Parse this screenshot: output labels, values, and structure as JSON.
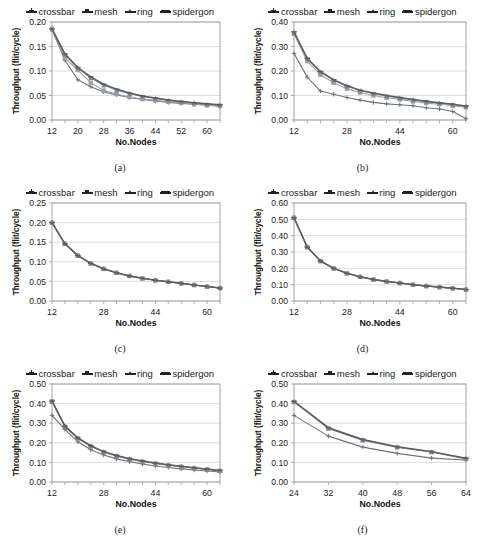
{
  "figure": {
    "panels": [
      "a",
      "b",
      "c",
      "d",
      "e",
      "f"
    ],
    "series_names": [
      "crossbar",
      "mesh",
      "ring",
      "spidergon"
    ],
    "series_colors": [
      "#6f7378",
      "#9aa0a6",
      "#7d8287",
      "#5a5f63"
    ],
    "axis_label_x": "No.Nodes",
    "axis_label_y": "Throughput (flit/cycle)"
  },
  "captions": {
    "a": "(a)",
    "b": "(b)",
    "c": "(c)",
    "d": "(d)",
    "e": "(e)",
    "f": "(f)"
  },
  "legend": {
    "crossbar": "crossbar",
    "mesh": "mesh",
    "ring": "ring",
    "spidergon": "spidergon"
  },
  "chart_data": [
    {
      "id": "a",
      "type": "line",
      "title": "(a)",
      "xlabel": "No.Nodes",
      "ylabel": "Throughput (flit/cycle)",
      "xlim": [
        12,
        64
      ],
      "ylim": [
        0.0,
        0.2
      ],
      "xticks": [
        12,
        20,
        28,
        36,
        44,
        52,
        60
      ],
      "yticks": [
        "0.00",
        "0.05",
        "0.10",
        "0.15",
        "0.20"
      ],
      "grid": true,
      "legend_position": "top",
      "x": [
        12,
        16,
        20,
        24,
        28,
        32,
        36,
        40,
        44,
        48,
        52,
        56,
        60,
        64
      ],
      "series": [
        {
          "name": "crossbar",
          "values": [
            0.185,
            0.122,
            0.082,
            0.068,
            0.057,
            0.051,
            0.046,
            0.042,
            0.039,
            0.036,
            0.034,
            0.032,
            0.03,
            0.028
          ]
        },
        {
          "name": "mesh",
          "values": [
            0.186,
            0.126,
            0.102,
            0.076,
            0.06,
            0.053,
            0.047,
            0.043,
            0.04,
            0.037,
            0.035,
            0.032,
            0.03,
            0.029
          ]
        },
        {
          "name": "ring",
          "values": [
            0.185,
            0.133,
            0.106,
            0.086,
            0.071,
            0.061,
            0.054,
            0.048,
            0.044,
            0.04,
            0.037,
            0.035,
            0.032,
            0.03
          ]
        },
        {
          "name": "spidergon",
          "values": [
            0.186,
            0.135,
            0.107,
            0.088,
            0.073,
            0.063,
            0.055,
            0.049,
            0.045,
            0.041,
            0.038,
            0.035,
            0.033,
            0.031
          ]
        }
      ]
    },
    {
      "id": "b",
      "type": "line",
      "title": "(b)",
      "xlabel": "No.Nodes",
      "ylabel": "Throughput (flit/cycle)",
      "xlim": [
        12,
        64
      ],
      "ylim": [
        0.0,
        0.4
      ],
      "xticks": [
        12,
        28,
        44,
        60
      ],
      "yticks": [
        "0.00",
        "0.10",
        "0.20",
        "0.30",
        "0.40"
      ],
      "grid": true,
      "legend_position": "top",
      "x": [
        12,
        16,
        20,
        24,
        28,
        32,
        36,
        40,
        44,
        48,
        52,
        56,
        60,
        64
      ],
      "series": [
        {
          "name": "crossbar",
          "values": [
            0.272,
            0.175,
            0.118,
            0.105,
            0.092,
            0.081,
            0.072,
            0.066,
            0.062,
            0.058,
            0.05,
            0.045,
            0.035,
            0.005
          ]
        },
        {
          "name": "mesh",
          "values": [
            0.352,
            0.24,
            0.185,
            0.152,
            0.128,
            0.112,
            0.1,
            0.091,
            0.084,
            0.076,
            0.069,
            0.064,
            0.058,
            0.052
          ]
        },
        {
          "name": "ring",
          "values": [
            0.358,
            0.25,
            0.196,
            0.162,
            0.138,
            0.12,
            0.108,
            0.098,
            0.09,
            0.082,
            0.075,
            0.069,
            0.063,
            0.056
          ]
        },
        {
          "name": "spidergon",
          "values": [
            0.36,
            0.252,
            0.198,
            0.164,
            0.14,
            0.122,
            0.11,
            0.1,
            0.092,
            0.084,
            0.077,
            0.07,
            0.064,
            0.057
          ]
        }
      ]
    },
    {
      "id": "c",
      "type": "line",
      "title": "(c)",
      "xlabel": "No.Nodes",
      "ylabel": "Throughput (flit/cycle)",
      "xlim": [
        12,
        64
      ],
      "ylim": [
        0.0,
        0.25
      ],
      "xticks": [
        12,
        28,
        44,
        60
      ],
      "yticks": [
        "0.00",
        "0.05",
        "0.10",
        "0.15",
        "0.20",
        "0.25"
      ],
      "grid": true,
      "legend_position": "top",
      "x": [
        12,
        16,
        20,
        24,
        28,
        32,
        36,
        40,
        44,
        48,
        52,
        56,
        60,
        64
      ],
      "series": [
        {
          "name": "crossbar",
          "values": [
            0.2,
            0.146,
            0.116,
            0.096,
            0.082,
            0.072,
            0.064,
            0.058,
            0.053,
            0.049,
            0.045,
            0.041,
            0.037,
            0.033
          ]
        },
        {
          "name": "mesh",
          "values": [
            0.2,
            0.146,
            0.116,
            0.096,
            0.082,
            0.072,
            0.064,
            0.058,
            0.053,
            0.049,
            0.045,
            0.041,
            0.037,
            0.033
          ]
        },
        {
          "name": "ring",
          "values": [
            0.2,
            0.146,
            0.116,
            0.096,
            0.082,
            0.072,
            0.064,
            0.058,
            0.053,
            0.049,
            0.045,
            0.041,
            0.037,
            0.033
          ]
        },
        {
          "name": "spidergon",
          "values": [
            0.2,
            0.146,
            0.116,
            0.096,
            0.082,
            0.072,
            0.064,
            0.058,
            0.053,
            0.049,
            0.045,
            0.041,
            0.037,
            0.033
          ]
        }
      ]
    },
    {
      "id": "d",
      "type": "line",
      "title": "(d)",
      "xlabel": "No.Nodes",
      "ylabel": "Throughput (flit/cycle)",
      "xlim": [
        12,
        64
      ],
      "ylim": [
        0.0,
        0.6
      ],
      "xticks": [
        12,
        28,
        44,
        60
      ],
      "yticks": [
        "0.00",
        "0.10",
        "0.20",
        "0.30",
        "0.40",
        "0.50",
        "0.60"
      ],
      "grid": true,
      "legend_position": "top",
      "x": [
        12,
        16,
        20,
        24,
        28,
        32,
        36,
        40,
        44,
        48,
        52,
        56,
        60,
        64
      ],
      "series": [
        {
          "name": "crossbar",
          "values": [
            0.51,
            0.33,
            0.245,
            0.2,
            0.17,
            0.148,
            0.132,
            0.12,
            0.11,
            0.1,
            0.092,
            0.085,
            0.078,
            0.07
          ]
        },
        {
          "name": "mesh",
          "values": [
            0.51,
            0.33,
            0.245,
            0.2,
            0.17,
            0.148,
            0.132,
            0.12,
            0.11,
            0.1,
            0.092,
            0.085,
            0.078,
            0.07
          ]
        },
        {
          "name": "ring",
          "values": [
            0.51,
            0.33,
            0.245,
            0.2,
            0.17,
            0.148,
            0.132,
            0.12,
            0.11,
            0.1,
            0.092,
            0.085,
            0.078,
            0.07
          ]
        },
        {
          "name": "spidergon",
          "values": [
            0.51,
            0.33,
            0.245,
            0.2,
            0.17,
            0.148,
            0.132,
            0.12,
            0.11,
            0.1,
            0.092,
            0.085,
            0.078,
            0.07
          ]
        }
      ]
    },
    {
      "id": "e",
      "type": "line",
      "title": "(e)",
      "xlabel": "No.Nodes",
      "ylabel": "Throughput (flit/cycle)",
      "xlim": [
        12,
        64
      ],
      "ylim": [
        0.0,
        0.5
      ],
      "xticks": [
        12,
        28,
        44,
        60
      ],
      "yticks": [
        "0.00",
        "0.10",
        "0.20",
        "0.30",
        "0.40",
        "0.50"
      ],
      "grid": true,
      "legend_position": "top",
      "x": [
        12,
        16,
        20,
        24,
        28,
        32,
        36,
        40,
        44,
        48,
        52,
        56,
        60,
        64
      ],
      "series": [
        {
          "name": "crossbar",
          "values": [
            0.34,
            0.268,
            0.205,
            0.165,
            0.138,
            0.118,
            0.104,
            0.092,
            0.082,
            0.074,
            0.067,
            0.061,
            0.056,
            0.051
          ]
        },
        {
          "name": "mesh",
          "values": [
            0.412,
            0.282,
            0.222,
            0.182,
            0.152,
            0.132,
            0.116,
            0.104,
            0.094,
            0.085,
            0.078,
            0.071,
            0.064,
            0.057
          ]
        },
        {
          "name": "ring",
          "values": [
            0.412,
            0.284,
            0.224,
            0.184,
            0.154,
            0.134,
            0.118,
            0.106,
            0.096,
            0.087,
            0.079,
            0.072,
            0.065,
            0.058
          ]
        },
        {
          "name": "spidergon",
          "values": [
            0.413,
            0.285,
            0.225,
            0.185,
            0.155,
            0.135,
            0.119,
            0.107,
            0.097,
            0.088,
            0.08,
            0.073,
            0.066,
            0.059
          ]
        }
      ]
    },
    {
      "id": "f",
      "type": "line",
      "title": "(f)",
      "xlabel": "No.Nodes",
      "ylabel": "Throughput (flit/cycle)",
      "xlim": [
        24,
        64
      ],
      "ylim": [
        0.0,
        0.5
      ],
      "xticks": [
        24,
        32,
        40,
        48,
        56,
        64
      ],
      "yticks": [
        "0.00",
        "0.10",
        "0.20",
        "0.30",
        "0.40",
        "0.50"
      ],
      "grid": true,
      "legend_position": "top",
      "x": [
        24,
        32,
        40,
        48,
        56,
        64
      ],
      "series": [
        {
          "name": "crossbar",
          "values": [
            0.34,
            0.234,
            0.178,
            0.146,
            0.122,
            0.112
          ]
        },
        {
          "name": "mesh",
          "values": [
            0.408,
            0.272,
            0.212,
            0.176,
            0.152,
            0.118
          ]
        },
        {
          "name": "ring",
          "values": [
            0.41,
            0.275,
            0.215,
            0.179,
            0.154,
            0.12
          ]
        },
        {
          "name": "spidergon",
          "values": [
            0.412,
            0.277,
            0.217,
            0.18,
            0.155,
            0.121
          ]
        }
      ]
    }
  ]
}
